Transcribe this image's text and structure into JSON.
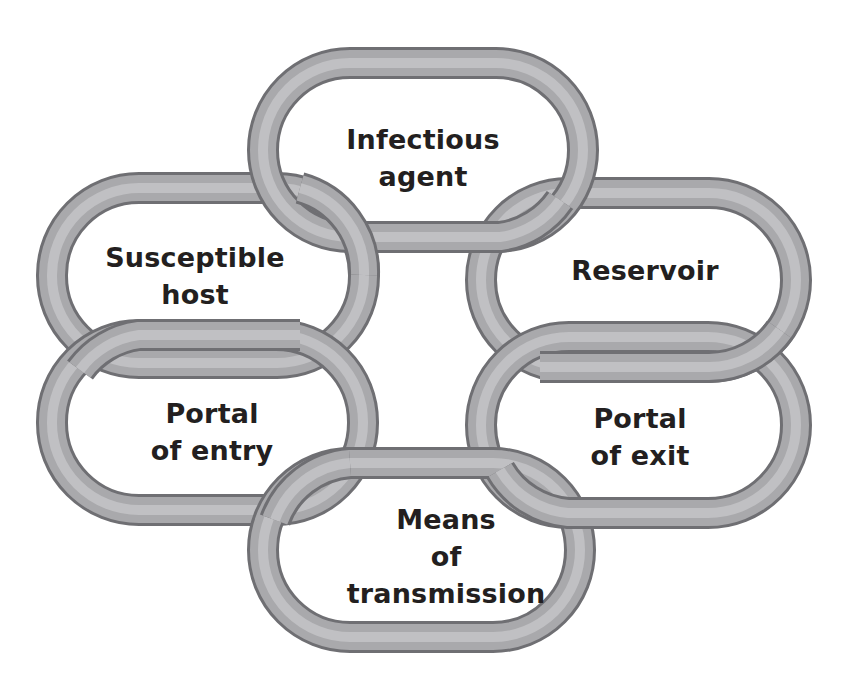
{
  "diagram": {
    "colors": {
      "link_light": "#c4c4c6",
      "link_mid": "#9a9a9d",
      "link_dark": "#6f6f73",
      "text": "#231f20",
      "background": "#ffffff"
    },
    "links": [
      {
        "id": "infectious-agent",
        "lines": [
          "Infectious",
          "agent"
        ],
        "center": [
          423,
          160
        ]
      },
      {
        "id": "reservoir",
        "lines": [
          "Reservoir"
        ],
        "center": [
          645,
          270
        ]
      },
      {
        "id": "portal-of-exit",
        "lines": [
          "Portal",
          "of exit"
        ],
        "center": [
          640,
          435
        ]
      },
      {
        "id": "means-of-transmission",
        "lines": [
          "Means",
          "of",
          "transmission"
        ],
        "center": [
          446,
          553
        ]
      },
      {
        "id": "portal-of-entry",
        "lines": [
          "Portal",
          "of entry"
        ],
        "center": [
          212,
          433
        ]
      },
      {
        "id": "susceptible-host",
        "lines": [
          "Susceptible",
          "host"
        ],
        "center": [
          195,
          277
        ]
      }
    ]
  }
}
